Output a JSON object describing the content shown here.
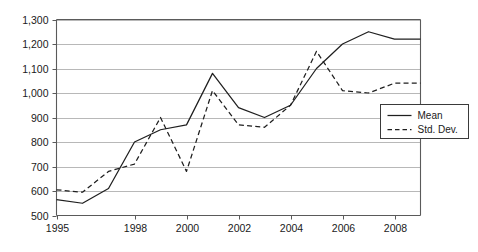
{
  "chart_data": {
    "type": "line",
    "title": "",
    "xlabel": "",
    "ylabel": "",
    "xlim": [
      1995,
      2009
    ],
    "ylim": [
      500,
      1300
    ],
    "grid": true,
    "legend_position": "bottom-right",
    "x": [
      1995,
      1996,
      1997,
      1998,
      1999,
      2000,
      2001,
      2002,
      2003,
      2004,
      2005,
      2006,
      2007,
      2008,
      2009
    ],
    "xticks": [
      1995,
      1998,
      2000,
      2002,
      2004,
      2006,
      2008
    ],
    "xticklabels": [
      "1995",
      "1998",
      "2000",
      "2002",
      "2004",
      "2006",
      "2008"
    ],
    "yticks": [
      500,
      600,
      700,
      800,
      900,
      1000,
      1100,
      1200,
      1300
    ],
    "yticklabels": [
      "500",
      "600",
      "700",
      "800",
      "900",
      "1,000",
      "1,100",
      "1,200",
      "1,300"
    ],
    "series": [
      {
        "name": "Mean",
        "style": "solid",
        "color": "#1f1f1f",
        "values": [
          565,
          550,
          610,
          800,
          850,
          870,
          1080,
          940,
          900,
          950,
          1100,
          1200,
          1250,
          1220,
          1220
        ]
      },
      {
        "name": "Std. Dev.",
        "style": "dashed",
        "color": "#1f1f1f",
        "values": [
          605,
          595,
          680,
          710,
          900,
          680,
          1010,
          870,
          860,
          950,
          1170,
          1010,
          1000,
          1040,
          1040
        ]
      }
    ]
  },
  "legend": {
    "entries": [
      {
        "label": "Mean",
        "style": "solid"
      },
      {
        "label": "Std. Dev.",
        "style": "dashed"
      }
    ]
  },
  "colors": {
    "line": "#1f1f1f",
    "grid": "#9a9a9a",
    "frame": "#5a5a5a",
    "background": "#ffffff"
  }
}
